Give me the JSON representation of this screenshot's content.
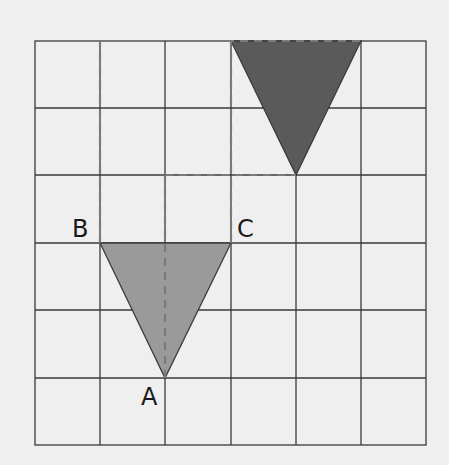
{
  "diagram": {
    "type": "grid-translation",
    "grid": {
      "columns": 6,
      "rows": 6
    },
    "colors": {
      "background": "#efefef",
      "grid_line": "#3a3a3a",
      "dashed_line": "#7a7a7a",
      "original_triangle": "#9a9a9a",
      "image_triangle": "#5a5a5a"
    },
    "original_triangle": {
      "vertices": {
        "B": [
          1,
          3
        ],
        "C": [
          3,
          3
        ],
        "A": [
          2,
          5
        ]
      }
    },
    "image_triangle": {
      "vertices": [
        [
          3,
          0
        ],
        [
          5,
          0
        ],
        [
          4,
          2
        ]
      ]
    },
    "labels": {
      "A": "A",
      "B": "B",
      "C": "C"
    }
  }
}
